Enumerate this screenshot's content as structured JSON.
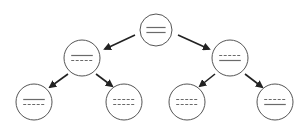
{
  "diagram": {
    "type": "binary-tree",
    "colors": {
      "stroke": "#555555",
      "line": "#6a6a6a",
      "arrow": "#222222",
      "background": "#ffffff"
    },
    "nodes": [
      {
        "id": "root",
        "cx": 156,
        "cy": 30,
        "r": 16,
        "lines": [
          "solid",
          "solid"
        ]
      },
      {
        "id": "mid-left",
        "cx": 82,
        "cy": 58,
        "r": 18,
        "lines": [
          "solid",
          "dashed"
        ]
      },
      {
        "id": "mid-right",
        "cx": 230,
        "cy": 58,
        "r": 18,
        "lines": [
          "dashed",
          "solid"
        ]
      },
      {
        "id": "leaf-1",
        "cx": 34,
        "cy": 102,
        "r": 18,
        "lines": [
          "solid",
          "dashed"
        ]
      },
      {
        "id": "leaf-2",
        "cx": 124,
        "cy": 102,
        "r": 18,
        "lines": [
          "dashed",
          "dashed"
        ]
      },
      {
        "id": "leaf-3",
        "cx": 187,
        "cy": 102,
        "r": 18,
        "lines": [
          "dashed",
          "dashed"
        ]
      },
      {
        "id": "leaf-4",
        "cx": 275,
        "cy": 102,
        "r": 18,
        "lines": [
          "dashed",
          "solid"
        ]
      }
    ],
    "edges": [
      {
        "from": "root",
        "to": "mid-left",
        "x1": 135,
        "y1": 35,
        "x2": 105,
        "y2": 49
      },
      {
        "from": "root",
        "to": "mid-right",
        "x1": 178,
        "y1": 35,
        "x2": 209,
        "y2": 49
      },
      {
        "from": "mid-left",
        "to": "leaf-1",
        "x1": 68,
        "y1": 74,
        "x2": 50,
        "y2": 87
      },
      {
        "from": "mid-left",
        "to": "leaf-2",
        "x1": 96,
        "y1": 74,
        "x2": 112,
        "y2": 86
      },
      {
        "from": "mid-right",
        "to": "leaf-3",
        "x1": 215,
        "y1": 74,
        "x2": 200,
        "y2": 86
      },
      {
        "from": "mid-right",
        "to": "leaf-4",
        "x1": 245,
        "y1": 74,
        "x2": 262,
        "y2": 87
      }
    ]
  }
}
